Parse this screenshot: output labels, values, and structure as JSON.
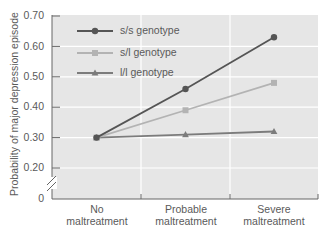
{
  "chart_data": {
    "type": "line",
    "title": "",
    "xlabel": "",
    "ylabel": "Probability of major depression episode",
    "categories": [
      "No maltreatment",
      "Probable maltreatment",
      "Severe maltreatment"
    ],
    "category_lines": [
      [
        "No",
        "maltreatment"
      ],
      [
        "Probable",
        "maltreatment"
      ],
      [
        "Severe",
        "maltreatment"
      ]
    ],
    "y_ticks": [
      "0",
      "0.20",
      "0.30",
      "0.40",
      "0.50",
      "0.60",
      "0.70"
    ],
    "ylim": [
      0,
      0.7
    ],
    "axis_break": true,
    "grid": true,
    "legend_position": "upper-left-inside",
    "series": [
      {
        "name": "s/s genotype",
        "marker": "circle",
        "color": "#555555",
        "values": [
          0.3,
          0.46,
          0.63
        ]
      },
      {
        "name": "s/l genotype",
        "marker": "square",
        "color": "#b3b3b3",
        "values": [
          0.3,
          0.39,
          0.48
        ]
      },
      {
        "name": "l/l genotype",
        "marker": "triangle",
        "color": "#7c7c7c",
        "values": [
          0.3,
          0.31,
          0.32
        ]
      }
    ]
  },
  "colors": {
    "plot_background": "#e6e6e6",
    "gridline": "#ffffff",
    "axis": "#666666",
    "text": "#5a5a5a"
  }
}
